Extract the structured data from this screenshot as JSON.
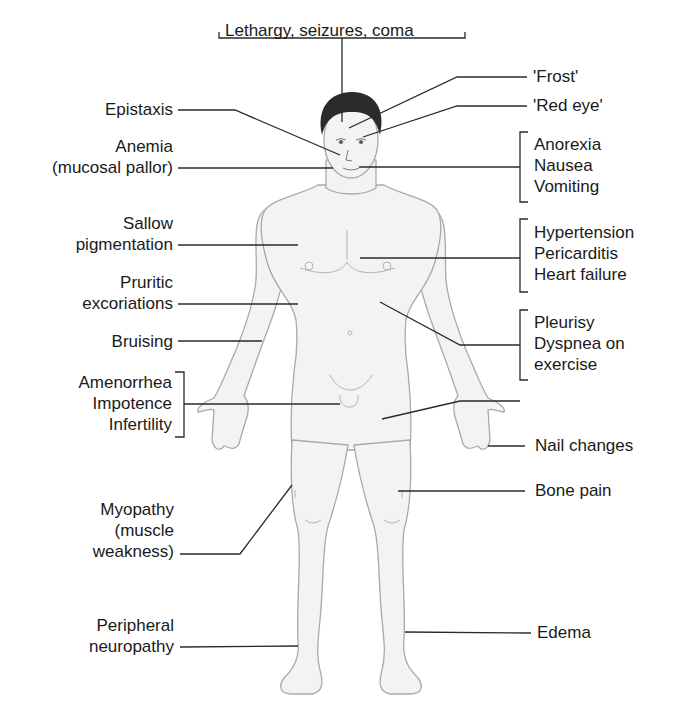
{
  "diagram": {
    "type": "anatomical-annotation",
    "top_label": "Lethargy, seizures, coma",
    "left_labels": [
      {
        "id": "epistaxis",
        "lines": [
          "Epistaxis"
        ]
      },
      {
        "id": "anemia",
        "lines": [
          "Anemia",
          "(mucosal pallor)"
        ]
      },
      {
        "id": "sallow",
        "lines": [
          "Sallow",
          "pigmentation"
        ]
      },
      {
        "id": "pruritic",
        "lines": [
          "Pruritic",
          "excoriations"
        ]
      },
      {
        "id": "bruising",
        "lines": [
          "Bruising"
        ]
      },
      {
        "id": "reproductive",
        "lines": [
          "Amenorrhea",
          "Impotence",
          "Infertility"
        ],
        "bracket": true
      },
      {
        "id": "myopathy",
        "lines": [
          "Myopathy",
          "(muscle",
          "weakness)"
        ]
      },
      {
        "id": "neuropathy",
        "lines": [
          "Peripheral",
          "neuropathy"
        ]
      }
    ],
    "right_labels": [
      {
        "id": "frost",
        "lines": [
          "'Frost'"
        ]
      },
      {
        "id": "redeye",
        "lines": [
          "'Red eye'"
        ]
      },
      {
        "id": "gi",
        "lines": [
          "Anorexia",
          "Nausea",
          "Vomiting"
        ],
        "bracket": true
      },
      {
        "id": "cardiac",
        "lines": [
          "Hypertension",
          "Pericarditis",
          "Heart failure"
        ],
        "bracket": true
      },
      {
        "id": "pulmonary",
        "lines": [
          "Pleurisy",
          "Dyspnea on",
          "exercise"
        ],
        "bracket": true
      },
      {
        "id": "nail",
        "lines": [
          "Nail changes"
        ]
      },
      {
        "id": "bone",
        "lines": [
          "Bone pain"
        ]
      },
      {
        "id": "edema",
        "lines": [
          "Edema"
        ]
      }
    ],
    "colors": {
      "line": "#2a2a2a",
      "text": "#1a1a1a",
      "skin": "#f2f2f2",
      "outline": "#a8a8a8",
      "hair": "#2b2b2b"
    }
  }
}
